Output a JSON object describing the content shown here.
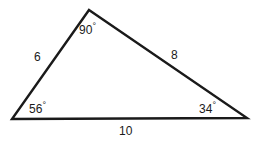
{
  "figure": {
    "type": "triangle-diagram",
    "background_color": "#ffffff",
    "stroke_color": "#1a1a1a",
    "text_color": "#1a1a1a",
    "stroke_width": 2.4,
    "vertices": {
      "apex": {
        "x": 89,
        "y": 10
      },
      "bottom_left": {
        "x": 12,
        "y": 119
      },
      "bottom_right": {
        "x": 247,
        "y": 118
      }
    }
  },
  "angles": {
    "apex": {
      "value": "90",
      "degree_symbol": "°",
      "text": "90°"
    },
    "bottom_left": {
      "value": "56",
      "degree_symbol": "°",
      "text": "56°"
    },
    "bottom_right": {
      "value": "34",
      "degree_symbol": "°",
      "text": "34°"
    }
  },
  "sides": {
    "left": {
      "text": "6"
    },
    "right": {
      "text": "8"
    },
    "bottom": {
      "text": "10"
    }
  }
}
